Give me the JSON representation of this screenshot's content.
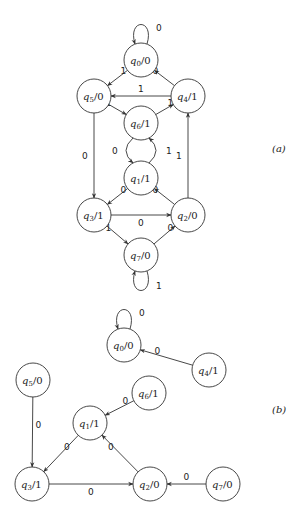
{
  "diagram_a": {
    "label": "(a)",
    "nodes": [
      {
        "id": "q0",
        "name": "q",
        "sub": "0",
        "out": "/0",
        "x": 141,
        "y": 60
      },
      {
        "id": "q5",
        "name": "q",
        "sub": "5",
        "out": "/0",
        "x": 94,
        "y": 96
      },
      {
        "id": "q4",
        "name": "q",
        "sub": "4",
        "out": "/1",
        "x": 188,
        "y": 96
      },
      {
        "id": "q6",
        "name": "q",
        "sub": "6",
        "out": "/1",
        "x": 141,
        "y": 123
      },
      {
        "id": "q1",
        "name": "q",
        "sub": "1",
        "out": "/1",
        "x": 141,
        "y": 178
      },
      {
        "id": "q3",
        "name": "q",
        "sub": "3",
        "out": "/1",
        "x": 94,
        "y": 215
      },
      {
        "id": "q2",
        "name": "q",
        "sub": "2",
        "out": "/0",
        "x": 188,
        "y": 215
      },
      {
        "id": "q7",
        "name": "q",
        "sub": "7",
        "out": "/0",
        "x": 141,
        "y": 255
      }
    ],
    "edges": [
      {
        "from": "q0",
        "to": "q0",
        "label": "0",
        "type": "loop-top"
      },
      {
        "from": "q0",
        "to": "q5",
        "label": "1"
      },
      {
        "from": "q4",
        "to": "q0",
        "label": "0"
      },
      {
        "from": "q4",
        "to": "q5",
        "label": "1"
      },
      {
        "from": "q5",
        "to": "q6",
        "label": "1"
      },
      {
        "from": "q6",
        "to": "q4",
        "label": "1"
      },
      {
        "from": "q5",
        "to": "q3",
        "label": "0"
      },
      {
        "from": "q6",
        "to": "q1",
        "label": "0",
        "type": "arc-left"
      },
      {
        "from": "q1",
        "to": "q6",
        "label": "1",
        "type": "arc-right"
      },
      {
        "from": "q2",
        "to": "q4",
        "label": "1"
      },
      {
        "from": "q1",
        "to": "q3",
        "label": "0"
      },
      {
        "from": "q2",
        "to": "q1",
        "label": "0"
      },
      {
        "from": "q3",
        "to": "q2",
        "label": "0"
      },
      {
        "from": "q3",
        "to": "q7",
        "label": "1"
      },
      {
        "from": "q7",
        "to": "q2",
        "label": "0"
      },
      {
        "from": "q7",
        "to": "q7",
        "label": "1",
        "type": "loop-bottom"
      }
    ]
  },
  "diagram_b": {
    "label": "(b)",
    "nodes": [
      {
        "id": "q0",
        "name": "q",
        "sub": "0",
        "out": "/0",
        "x": 124,
        "y": 345
      },
      {
        "id": "q4",
        "name": "q",
        "sub": "4",
        "out": "/1",
        "x": 209,
        "y": 370
      },
      {
        "id": "q5",
        "name": "q",
        "sub": "5",
        "out": "/0",
        "x": 33,
        "y": 380
      },
      {
        "id": "q6",
        "name": "q",
        "sub": "6",
        "out": "/1",
        "x": 149,
        "y": 393
      },
      {
        "id": "q1",
        "name": "q",
        "sub": "1",
        "out": "/1",
        "x": 90,
        "y": 423
      },
      {
        "id": "q3",
        "name": "q",
        "sub": "3",
        "out": "/1",
        "x": 32,
        "y": 484
      },
      {
        "id": "q2",
        "name": "q",
        "sub": "2",
        "out": "/0",
        "x": 150,
        "y": 484
      },
      {
        "id": "q7",
        "name": "q",
        "sub": "7",
        "out": "/0",
        "x": 223,
        "y": 484
      }
    ],
    "edges": [
      {
        "from": "q0",
        "to": "q0",
        "label": "0",
        "type": "loop-top"
      },
      {
        "from": "q4",
        "to": "q0",
        "label": "0"
      },
      {
        "from": "q5",
        "to": "q3",
        "label": "0"
      },
      {
        "from": "q6",
        "to": "q1",
        "label": "0"
      },
      {
        "from": "q1",
        "to": "q3",
        "label": "0"
      },
      {
        "from": "q2",
        "to": "q1",
        "label": "0"
      },
      {
        "from": "q3",
        "to": "q2",
        "label": "0"
      },
      {
        "from": "q7",
        "to": "q2",
        "label": "0"
      }
    ]
  },
  "style": {
    "stroke": "#333333",
    "node_radius": 17
  }
}
